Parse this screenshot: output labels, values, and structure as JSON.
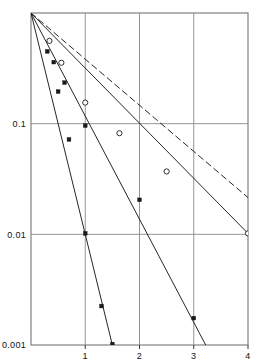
{
  "chart_data": {
    "type": "line",
    "scale": {
      "x": "linear",
      "y": "log"
    },
    "title": "",
    "subtitle": "",
    "xlabel": "",
    "ylabel": "",
    "xlim": [
      0,
      4
    ],
    "ylim": [
      0.001,
      1.0
    ],
    "grid": true,
    "legend_position": "none",
    "xticks": [
      {
        "value": 1,
        "label": "1"
      },
      {
        "value": 2,
        "label": "2"
      },
      {
        "value": 3,
        "label": "3"
      },
      {
        "value": 4,
        "label": "4"
      }
    ],
    "yticks": [
      {
        "value": 0.1,
        "label": "0.1"
      },
      {
        "value": 0.01,
        "label": "0.01"
      },
      {
        "value": 0.001,
        "label": "0.001"
      }
    ],
    "series": [
      {
        "name": "curve-1-steep",
        "style": "solid",
        "marker": "filled-square",
        "color": "#1a1a1a",
        "line": [
          [
            0.0,
            1.0
          ],
          [
            1.5,
            0.001
          ]
        ],
        "points": [
          {
            "x": 0.3,
            "y": 0.45
          },
          {
            "x": 0.5,
            "y": 0.195
          },
          {
            "x": 0.7,
            "y": 0.072
          },
          {
            "x": 1.0,
            "y": 0.0102
          },
          {
            "x": 1.3,
            "y": 0.00225
          },
          {
            "x": 1.5,
            "y": 0.00102
          }
        ]
      },
      {
        "name": "curve-2-middle",
        "style": "solid",
        "marker": "filled-square",
        "color": "#1a1a1a",
        "line": [
          [
            0.0,
            1.0
          ],
          [
            3.22,
            0.001
          ]
        ],
        "points": [
          {
            "x": 0.42,
            "y": 0.36
          },
          {
            "x": 0.62,
            "y": 0.235
          },
          {
            "x": 1.0,
            "y": 0.096
          },
          {
            "x": 2.0,
            "y": 0.0205
          },
          {
            "x": 3.0,
            "y": 0.00175
          }
        ]
      },
      {
        "name": "curve-3-circles",
        "style": "solid",
        "marker": "open-circle",
        "color": "#1a1a1a",
        "line": [
          [
            0.0,
            1.0
          ],
          [
            4.0,
            0.0102
          ]
        ],
        "points": [
          {
            "x": 0.34,
            "y": 0.56
          },
          {
            "x": 0.56,
            "y": 0.355
          },
          {
            "x": 1.0,
            "y": 0.155
          },
          {
            "x": 1.63,
            "y": 0.082
          },
          {
            "x": 2.5,
            "y": 0.037
          },
          {
            "x": 4.0,
            "y": 0.0102
          }
        ]
      },
      {
        "name": "curve-4-dashed",
        "style": "dashed",
        "marker": "none",
        "color": "#1a1a1a",
        "line": [
          [
            0.0,
            1.0
          ],
          [
            4.0,
            0.0215
          ]
        ],
        "points": []
      }
    ]
  },
  "axes": {
    "frame_color": "#6e6e6e",
    "grid_color": "#8a8a8a",
    "tick_color": "#333333"
  }
}
